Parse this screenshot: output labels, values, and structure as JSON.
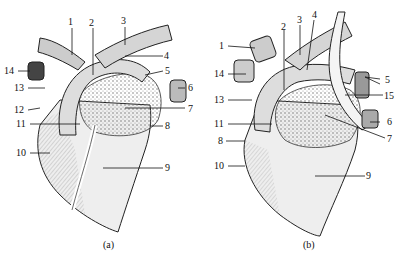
{
  "figure": {
    "panels": [
      {
        "caption": "(a)",
        "labels": [
          "1",
          "2",
          "3",
          "4",
          "5",
          "6",
          "7",
          "8",
          "9",
          "10",
          "11",
          "12",
          "13",
          "14"
        ]
      },
      {
        "caption": "(b)",
        "labels": [
          "1",
          "2",
          "3",
          "4",
          "5",
          "6",
          "7",
          "8",
          "9",
          "10",
          "11",
          "13",
          "14",
          "15"
        ]
      }
    ]
  },
  "colors": {
    "ink": "#111111",
    "shade": "#9a9a9a",
    "light": "#e6e6e6",
    "background": "#ffffff"
  }
}
